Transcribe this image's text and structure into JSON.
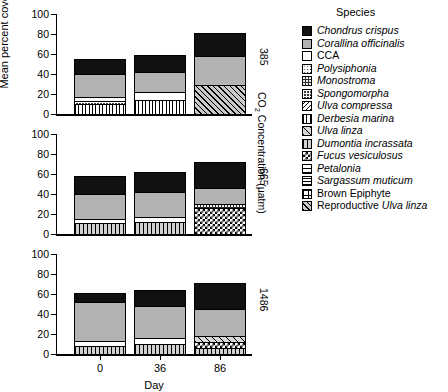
{
  "axes": {
    "ylabel": "Mean percent cover",
    "xlabel": "Day",
    "yticks": [
      "0",
      "20",
      "40",
      "60",
      "80",
      "100"
    ],
    "ytick_values": [
      0,
      20,
      40,
      60,
      80,
      100
    ],
    "ylim": [
      0,
      100
    ],
    "xticks": [
      "0",
      "36",
      "86"
    ],
    "group_axis_title": "CO2 Concentration (µatm)",
    "group_axis_title_prefix": "CO",
    "group_axis_title_sub": "2",
    "group_axis_title_suffix": " Concentration (µatm)"
  },
  "legend": {
    "title": "Species",
    "items": [
      {
        "label": "Chondrus crispus",
        "italic": true,
        "pattern": "p-solid-black"
      },
      {
        "label": "Corallina officinalis",
        "italic": true,
        "pattern": "p-gray"
      },
      {
        "label": "CCA",
        "italic": false,
        "pattern": "p-white"
      },
      {
        "label": "Polysiphonia",
        "italic": true,
        "pattern": "p-dots"
      },
      {
        "label": "Monostroma",
        "italic": true,
        "pattern": "p-darkspeck"
      },
      {
        "label": "Spongomorpha",
        "italic": true,
        "pattern": "p-crosshatch-dense"
      },
      {
        "label": "Ulva compressa",
        "italic": true,
        "pattern": "p-diag-dense"
      },
      {
        "label": "Derbesia marina",
        "italic": true,
        "pattern": "p-vert"
      },
      {
        "label": "Ulva linza",
        "italic": true,
        "pattern": "p-diag-wide"
      },
      {
        "label": "Dumontia incrassata",
        "italic": true,
        "pattern": "p-vert-gray"
      },
      {
        "label": "Fucus vesiculosus",
        "italic": true,
        "pattern": "p-checker"
      },
      {
        "label": "Petalonia",
        "italic": true,
        "pattern": "p-horiz-sparse"
      },
      {
        "label": "Sargassum muticum",
        "italic": true,
        "pattern": "p-horiz-dense"
      },
      {
        "label": "Brown Epiphyte",
        "italic": false,
        "pattern": "p-grid"
      },
      {
        "label": "Reproductive Ulva linza",
        "italic": "partial",
        "pattern": "p-diag-hatchgray",
        "plain_prefix": "Reproductive ",
        "italic_suffix": "Ulva linza"
      }
    ]
  },
  "chart_data": {
    "type": "bar",
    "subtype": "stacked",
    "title": "",
    "xlabel": "Day",
    "ylabel": "Mean percent cover",
    "ylim": [
      0,
      100
    ],
    "grid": false,
    "legend_position": "right",
    "categories": [
      "0",
      "36",
      "86"
    ],
    "panels": [
      {
        "label": "385",
        "bars": [
          {
            "day": "0",
            "total": 55,
            "segments": [
              {
                "species": "Derbesia marina",
                "pattern": "p-vert",
                "value": 9
              },
              {
                "species": "Spongomorpha",
                "pattern": "p-crosshatch-dense",
                "value": 3
              },
              {
                "species": "CCA",
                "pattern": "p-white",
                "value": 4
              },
              {
                "species": "Corallina officinalis",
                "pattern": "p-gray",
                "value": 24
              },
              {
                "species": "Chondrus crispus",
                "pattern": "p-solid-black",
                "value": 15
              }
            ]
          },
          {
            "day": "36",
            "total": 59,
            "segments": [
              {
                "species": "Derbesia marina",
                "pattern": "p-vert",
                "value": 13
              },
              {
                "species": "CCA",
                "pattern": "p-white",
                "value": 8
              },
              {
                "species": "Corallina officinalis",
                "pattern": "p-gray",
                "value": 21
              },
              {
                "species": "Chondrus crispus",
                "pattern": "p-solid-black",
                "value": 17
              }
            ]
          },
          {
            "day": "86",
            "total": 81,
            "segments": [
              {
                "species": "Reproductive Ulva linza",
                "pattern": "p-diag-hatchgray",
                "value": 28
              },
              {
                "species": "Corallina officinalis",
                "pattern": "p-gray",
                "value": 30
              },
              {
                "species": "Chondrus crispus",
                "pattern": "p-solid-black",
                "value": 23
              }
            ]
          }
        ]
      },
      {
        "label": "665",
        "bars": [
          {
            "day": "0",
            "total": 58,
            "segments": [
              {
                "species": "Dumontia incrassata",
                "pattern": "p-vert-gray",
                "value": 10
              },
              {
                "species": "CCA",
                "pattern": "p-white",
                "value": 4
              },
              {
                "species": "Corallina officinalis",
                "pattern": "p-gray",
                "value": 26
              },
              {
                "species": "Chondrus crispus",
                "pattern": "p-solid-black",
                "value": 18
              }
            ]
          },
          {
            "day": "36",
            "total": 62,
            "segments": [
              {
                "species": "Dumontia incrassata",
                "pattern": "p-vert-gray",
                "value": 11
              },
              {
                "species": "CCA",
                "pattern": "p-white",
                "value": 5
              },
              {
                "species": "Corallina officinalis",
                "pattern": "p-gray",
                "value": 26
              },
              {
                "species": "Chondrus crispus",
                "pattern": "p-solid-black",
                "value": 20
              }
            ]
          },
          {
            "day": "86",
            "total": 72,
            "segments": [
              {
                "species": "Fucus vesiculosus",
                "pattern": "p-checker",
                "value": 25
              },
              {
                "species": "Monostroma",
                "pattern": "p-darkspeck",
                "value": 4
              },
              {
                "species": "Corallina officinalis",
                "pattern": "p-gray",
                "value": 17
              },
              {
                "species": "Chondrus crispus",
                "pattern": "p-solid-black",
                "value": 26
              }
            ]
          }
        ]
      },
      {
        "label": "1486",
        "bars": [
          {
            "day": "0",
            "total": 61,
            "segments": [
              {
                "species": "Dumontia incrassata",
                "pattern": "p-vert-gray",
                "value": 7
              },
              {
                "species": "CCA",
                "pattern": "p-white",
                "value": 5
              },
              {
                "species": "Corallina officinalis",
                "pattern": "p-gray",
                "value": 40
              },
              {
                "species": "Chondrus crispus",
                "pattern": "p-solid-black",
                "value": 9
              }
            ]
          },
          {
            "day": "36",
            "total": 64,
            "segments": [
              {
                "species": "Dumontia incrassata",
                "pattern": "p-vert-gray",
                "value": 9
              },
              {
                "species": "CCA",
                "pattern": "p-white",
                "value": 6
              },
              {
                "species": "Corallina officinalis",
                "pattern": "p-gray",
                "value": 33
              },
              {
                "species": "Chondrus crispus",
                "pattern": "p-solid-black",
                "value": 16
              }
            ]
          },
          {
            "day": "86",
            "total": 71,
            "segments": [
              {
                "species": "Dumontia incrassata",
                "pattern": "p-vert-gray",
                "value": 5
              },
              {
                "species": "Fucus vesiculosus",
                "pattern": "p-checker",
                "value": 6
              },
              {
                "species": "Ulva linza",
                "pattern": "p-diag-wide",
                "value": 6
              },
              {
                "species": "Corallina officinalis",
                "pattern": "p-gray",
                "value": 28
              },
              {
                "species": "Chondrus crispus",
                "pattern": "p-solid-black",
                "value": 26
              }
            ]
          }
        ]
      }
    ]
  }
}
